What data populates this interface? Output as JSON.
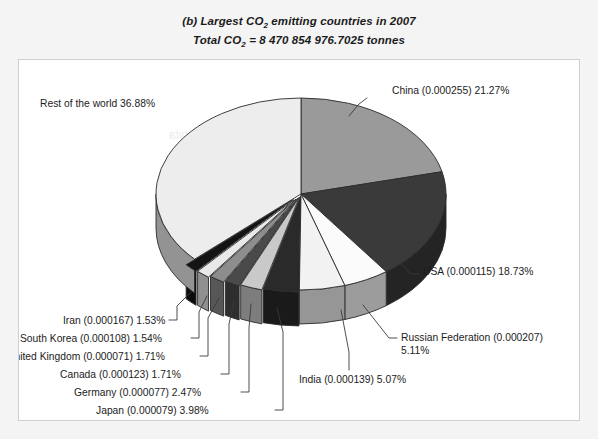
{
  "title": {
    "line1_prefix": "(b) Largest CO",
    "line1_sub": "2",
    "line1_suffix": " emitting countries in 2007",
    "line2_prefix": "Total CO",
    "line2_sub": "2",
    "line2_suffix": " = 8 470 854 976.7025 tonnes"
  },
  "labels": {
    "china": "China (0.000255) 21.27%",
    "usa": "USA (0.000115) 18.73%",
    "russia_line1": "Russian Federation (0.000207)",
    "russia_line2": "5.11%",
    "india": "India (0.000139) 5.07%",
    "japan": "Japan (0.000079) 3.98%",
    "germany": "Germany (0.000077) 2.47%",
    "canada": "Canada (0.000123) 1.71%",
    "uk": "United Kingdom (0.000071) 1.71%",
    "south_korea": "South Korea (0.000108) 1.54%",
    "iran": "Iran (0.000167) 1.53%",
    "rest": "Rest of the world 36.88%"
  },
  "chart_data": {
    "type": "pie",
    "title": "(b) Largest CO2 emitting countries in 2007",
    "subtitle": "Total CO2 = 8 470 854 976.7025 tonnes",
    "total_tonnes": "8 470 854 976.7025",
    "unit": "tonnes",
    "three_d": true,
    "legend": "none",
    "labels_position": "outside-with-leader-lines",
    "categories": [
      "China",
      "USA",
      "Russian Federation",
      "India",
      "Japan",
      "Germany",
      "Canada",
      "United Kingdom",
      "South Korea",
      "Iran",
      "Rest of the world"
    ],
    "values": [
      21.27,
      18.73,
      5.11,
      5.07,
      3.98,
      2.47,
      1.71,
      1.71,
      1.54,
      1.53,
      36.88
    ],
    "per_capita": [
      0.000255,
      0.000115,
      0.000207,
      0.000139,
      7.9e-05,
      7.7e-05,
      0.000123,
      7.1e-05,
      0.000108,
      0.000167,
      null
    ],
    "slice_colors": [
      "#9a9a9a",
      "#3a3a3a",
      "#fbfbfb",
      "#f2f2f2",
      "#2a2a2a",
      "#c9c9c9",
      "#4a4a4a",
      "#8d8d8d",
      "#e9e9e9",
      "#141414",
      "#ededed"
    ],
    "ylabel": "",
    "xlabel": ""
  },
  "colors": {
    "page_bg": "#f4f4f4",
    "chart_bg": "#ffffff",
    "text": "#1c1c1c",
    "outline": "#2b2b2b"
  }
}
